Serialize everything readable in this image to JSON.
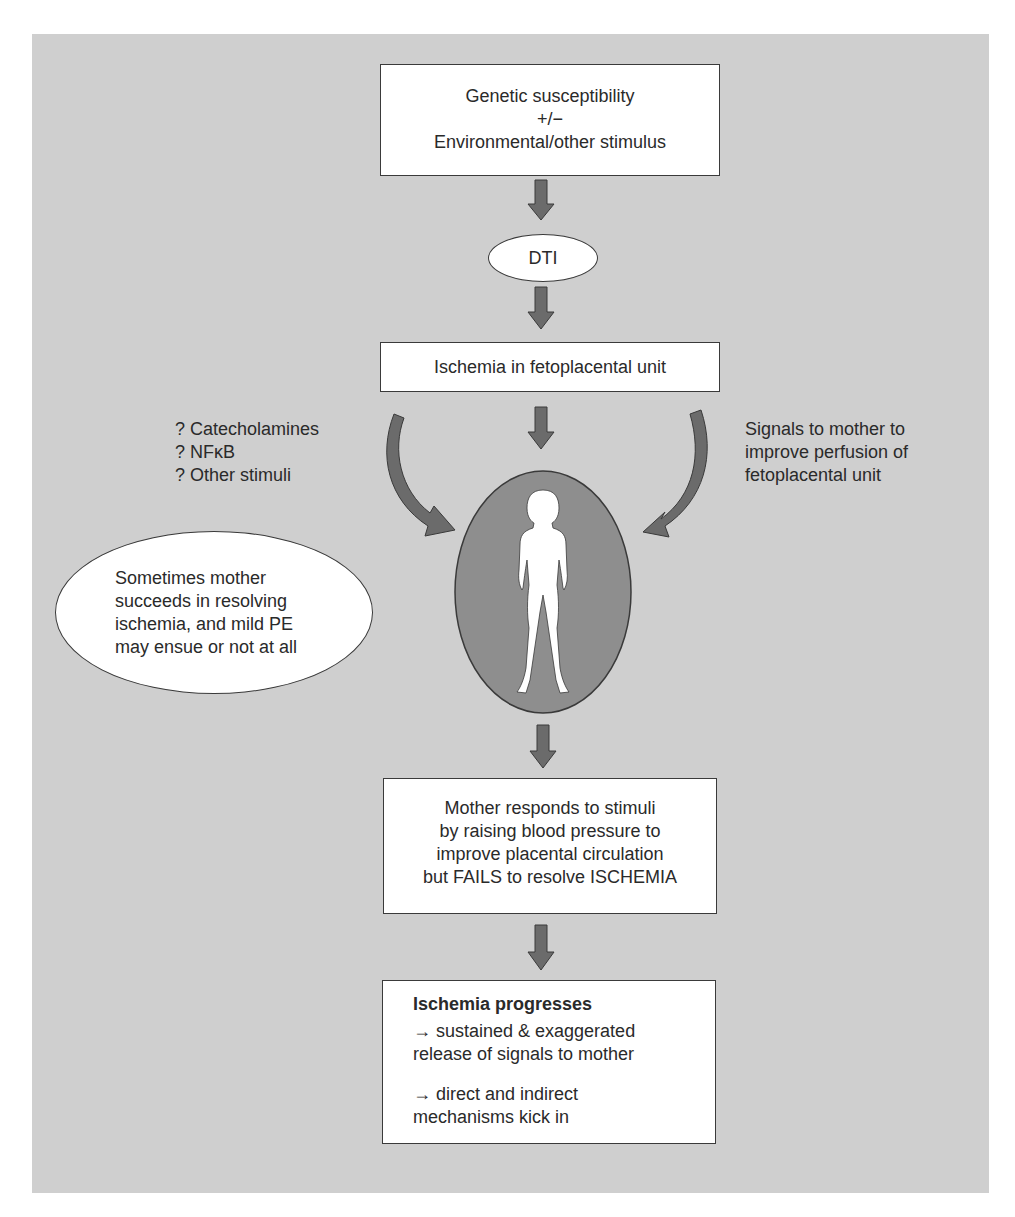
{
  "diagram": {
    "nodes": {
      "genetic": {
        "lines": [
          "Genetic susceptibility",
          "+/−",
          "Environmental/other stimulus"
        ]
      },
      "dti": {
        "label": "DTI"
      },
      "ischemia_unit": {
        "label": "Ischemia in fetoplacental unit"
      },
      "left_stimuli": {
        "lines": [
          "? Catecholamines",
          "? NFκB",
          "? Other stimuli"
        ]
      },
      "right_signals": {
        "lines": [
          "Signals to mother to",
          "improve perfusion of",
          "fetoplacental unit"
        ]
      },
      "mother_succeeds": {
        "lines": [
          "Sometimes mother",
          "succeeds in resolving",
          "ischemia, and mild PE",
          "may ensue or not at all"
        ]
      },
      "mother_figure": {
        "icon": "woman-silhouette-icon"
      },
      "mother_responds": {
        "lines": [
          "Mother responds to stimuli",
          "by raising blood pressure to",
          "improve placental circulation",
          "but FAILS to resolve ISCHEMIA"
        ]
      },
      "ischemia_progresses": {
        "title": "Ischemia progresses",
        "lines": [
          "→ sustained & exaggerated",
          "release of signals to mother",
          "→ direct and indirect",
          "mechanisms kick in"
        ]
      }
    },
    "colors": {
      "background": "#cfcfcf",
      "box_fill": "#ffffff",
      "arrow_fill": "#6b6b6b",
      "mother_ellipse_fill": "#8e8e8e",
      "outline": "#3a3a3a"
    }
  }
}
